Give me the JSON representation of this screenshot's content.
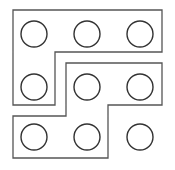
{
  "diagram": {
    "title": "",
    "stroke_color": "#555555",
    "circle_stroke_color": "#333333",
    "background": "#ffffff",
    "circle_radius": 13,
    "grid": {
      "rows": 3,
      "cols": 3,
      "col_x": [
        34,
        87,
        140
      ],
      "row_y": [
        34,
        87,
        137
      ]
    },
    "shapes": [
      {
        "name": "upper-l-shape",
        "points": "13,10 162,10 162,52 55,52 55,105 13,105"
      },
      {
        "name": "lower-z-shape",
        "points": "66,63 162,63 162,105 108,105 108,158 13,158 13,116 66,116"
      }
    ],
    "circles": [
      {
        "row": 1,
        "col": 1,
        "cx": 34,
        "cy": 34,
        "enclosed_by": "upper-l-shape"
      },
      {
        "row": 1,
        "col": 2,
        "cx": 87,
        "cy": 34,
        "enclosed_by": "upper-l-shape"
      },
      {
        "row": 1,
        "col": 3,
        "cx": 140,
        "cy": 34,
        "enclosed_by": "upper-l-shape"
      },
      {
        "row": 2,
        "col": 1,
        "cx": 34,
        "cy": 87,
        "enclosed_by": "upper-l-shape"
      },
      {
        "row": 2,
        "col": 2,
        "cx": 87,
        "cy": 87,
        "enclosed_by": "lower-z-shape"
      },
      {
        "row": 2,
        "col": 3,
        "cx": 140,
        "cy": 87,
        "enclosed_by": "lower-z-shape"
      },
      {
        "row": 3,
        "col": 1,
        "cx": 34,
        "cy": 137,
        "enclosed_by": "lower-z-shape"
      },
      {
        "row": 3,
        "col": 2,
        "cx": 87,
        "cy": 137,
        "enclosed_by": "lower-z-shape"
      },
      {
        "row": 3,
        "col": 3,
        "cx": 140,
        "cy": 137,
        "enclosed_by": "none"
      }
    ]
  }
}
